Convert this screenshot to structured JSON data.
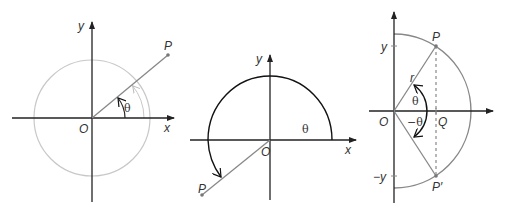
{
  "figure": {
    "panels": [
      {
        "id": "panel-1",
        "labels": {
          "y_axis": "y",
          "x_axis": "x",
          "origin": "O",
          "point": "P",
          "angle": "θ"
        }
      },
      {
        "id": "panel-2",
        "labels": {
          "y_axis": "y",
          "x_axis": "x",
          "origin": "O",
          "point": "P",
          "angle": "θ"
        }
      },
      {
        "id": "panel-3",
        "labels": {
          "y_tick": "y",
          "neg_y_tick": "−y",
          "origin": "O",
          "foot": "Q",
          "point": "P",
          "point_reflected": "P′",
          "radius": "r",
          "angle_pos": "θ",
          "angle_neg": "−θ"
        }
      }
    ],
    "colors": {
      "axis": "#222222",
      "ray": "#777777",
      "light_circle": "#c0c0c0",
      "dark_arc": "#111111",
      "semicircle_gray": "#888888",
      "text": "#333333"
    }
  }
}
